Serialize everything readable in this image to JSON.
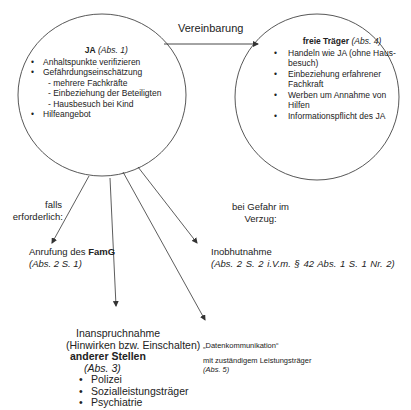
{
  "left_node": {
    "title": "JA",
    "title_ref": "(Abs. 1)",
    "items": [
      {
        "label": "Anhaltspunkte verifizieren"
      },
      {
        "label": "Gefährdungseinschätzung",
        "sub": [
          "- mehrere Fachkräfte",
          "- Einbeziehung der Beteiligten",
          "- Hausbesuch bei Kind"
        ]
      },
      {
        "label": "Hilfeangebot"
      }
    ]
  },
  "connector": {
    "label": "Vereinbarung"
  },
  "right_node": {
    "title": "freie Träger",
    "title_ref": "(Abs. 4)",
    "items": [
      {
        "label": "Handeln wie JA (ohne Haus-besuch)"
      },
      {
        "label": "Einbeziehung erfahrener Fachkraft"
      },
      {
        "label": "Werben um Annahme von Hilfen"
      },
      {
        "label": "Informationspflicht des JA"
      }
    ]
  },
  "conditions": {
    "falls_line1": "falls",
    "falls_line2": "erforderlich:",
    "gefahr_line1": "bei Gefahr im",
    "gefahr_line2": "Verzug:"
  },
  "outcomes": {
    "famg": {
      "prefix": "Anrufung des ",
      "bold": "FamG",
      "ref": "(Abs. 2 S. 1)"
    },
    "inobhut": {
      "label": "Inobhutnahme",
      "ref": "(Abs. 2 S. 2 i.V.m. § 42 Abs. 1 S. 1 Nr. 2)"
    },
    "inanspruch": {
      "line1": "Inanspruchnahme",
      "line2": "(Hinwirken bzw. Einschalten)",
      "bold": "anderer Stellen",
      "ref": "(Abs. 3)",
      "items": [
        "Polizei",
        "Sozialleistungsträger",
        "Psychiatrie"
      ]
    },
    "daten": {
      "line1": "„Datenkommunikation“",
      "line2": "mit zuständigem Leistungsträger",
      "ref": "(Abs. 5)"
    }
  }
}
